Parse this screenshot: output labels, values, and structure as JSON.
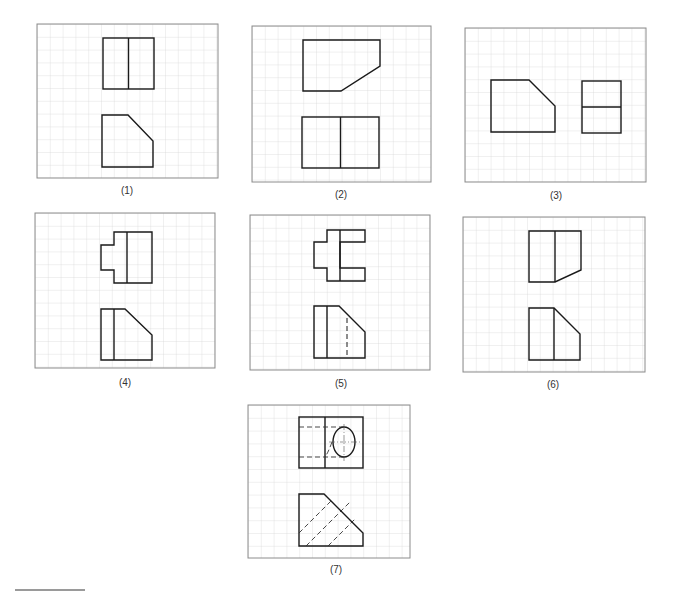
{
  "figure": {
    "grid_color": "#d6d6d6",
    "frame_color": "#8c8c8c",
    "line_color": "#1a1a1a",
    "panels": [
      {
        "id": 1,
        "label": "(1)",
        "x": 37,
        "y": 24,
        "w": 181,
        "h": 154,
        "label_x": 127,
        "label_y": 185
      },
      {
        "id": 2,
        "label": "(2)",
        "x": 252,
        "y": 26,
        "w": 179,
        "h": 156,
        "label_x": 341,
        "label_y": 189
      },
      {
        "id": 3,
        "label": "(3)",
        "x": 465,
        "y": 28,
        "w": 181,
        "h": 154,
        "label_x": 556,
        "label_y": 190
      },
      {
        "id": 4,
        "label": "(4)",
        "x": 35,
        "y": 213,
        "w": 180,
        "h": 155,
        "label_x": 125,
        "label_y": 377
      },
      {
        "id": 5,
        "label": "(5)",
        "x": 250,
        "y": 215,
        "w": 180,
        "h": 155,
        "label_x": 341,
        "label_y": 378
      },
      {
        "id": 6,
        "label": "(6)",
        "x": 463,
        "y": 217,
        "w": 182,
        "h": 155,
        "label_x": 553,
        "label_y": 379
      },
      {
        "id": 7,
        "label": "(7)",
        "x": 248,
        "y": 405,
        "w": 162,
        "h": 153,
        "label_x": 336,
        "label_y": 564
      }
    ]
  }
}
